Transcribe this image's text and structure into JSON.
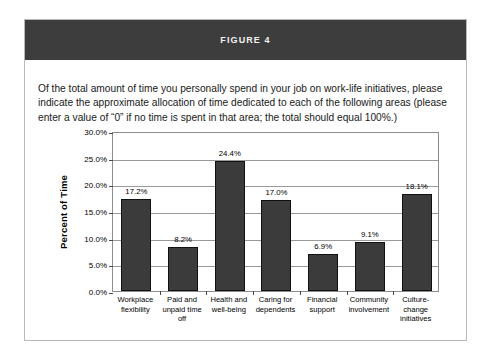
{
  "figure": {
    "header_title": "FIGURE 4",
    "prompt": "Of the total amount of time you personally spend in your job on work-life initiatives, please indicate the approximate allocation of time dedicated to each of the following areas (please enter a value of “0” if no time is spent in that area; the total should equal 100%.)"
  },
  "colors": {
    "header_bg": "#3d3d3d",
    "header_text": "#f2f2f2",
    "bar_fill": "#3b3b3b",
    "bar_stroke": "#111111",
    "gridline": "#9a9a9a",
    "plot_border": "#8d8d8d",
    "figure_border": "#b9b9b9",
    "page_bg": "#ffffff"
  },
  "chart_data": {
    "type": "bar",
    "title": "",
    "xlabel": "",
    "ylabel": "Percent of Time",
    "ylim": [
      0,
      30
    ],
    "ytick_step": 5,
    "ytick_labels": [
      "0.0%",
      "5.0%",
      "10.0%",
      "15.0%",
      "20.0%",
      "25.0%",
      "30.0%"
    ],
    "ytick_values": [
      0,
      5,
      10,
      15,
      20,
      25,
      30
    ],
    "grid": true,
    "legend": false,
    "categories": [
      "Workplace flexibility",
      "Paid and unpaid time off",
      "Health and well-being",
      "Caring for dependents",
      "Financial support",
      "Community involvement",
      "Culture-change initiatives"
    ],
    "values": [
      17.2,
      8.2,
      24.4,
      17.0,
      6.9,
      9.1,
      18.1
    ],
    "data_labels": [
      "17.2%",
      "8.2%",
      "24.4%",
      "17.0%",
      "6.9%",
      "9.1%",
      "18.1%"
    ]
  }
}
